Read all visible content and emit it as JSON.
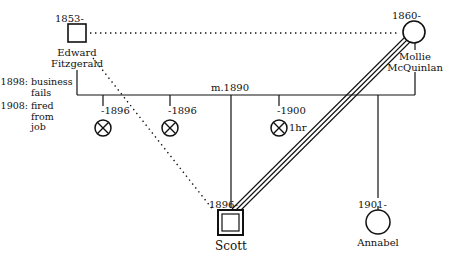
{
  "people": {
    "edward": {
      "name_line1": "Edward",
      "name_line2": "Fitzgerald",
      "birth": "1853-",
      "sex": "male"
    },
    "mollie": {
      "name_line1": "Mollie",
      "name_line2": "McQuinlan",
      "birth": "1860-",
      "sex": "female"
    },
    "scott": {
      "name": "Scott",
      "birth": "1896-",
      "sex": "male",
      "role": "identified-patient"
    },
    "annabel": {
      "name": "Annabel",
      "birth": "1901-",
      "sex": "female"
    }
  },
  "marriage": {
    "label": "m.1890"
  },
  "losses": [
    {
      "label": "-1896",
      "note": ""
    },
    {
      "label": "-1896",
      "note": ""
    },
    {
      "label": "-1900",
      "note": "1hr"
    }
  ],
  "edward_events": [
    {
      "year": "1898:",
      "lines": [
        "business",
        "fails"
      ]
    },
    {
      "year": "1908:",
      "lines": [
        "fired",
        "from",
        "job"
      ]
    }
  ],
  "relationships": [
    {
      "from": "Edward",
      "to": "Mollie",
      "type": "distant (dotted)"
    },
    {
      "from": "Edward",
      "to": "Scott",
      "type": "distant (dotted)"
    },
    {
      "from": "Mollie",
      "to": "Scott",
      "type": "fused / very close (triple line)"
    }
  ],
  "colors": {
    "line": "#111111",
    "background": "#ffffff"
  }
}
